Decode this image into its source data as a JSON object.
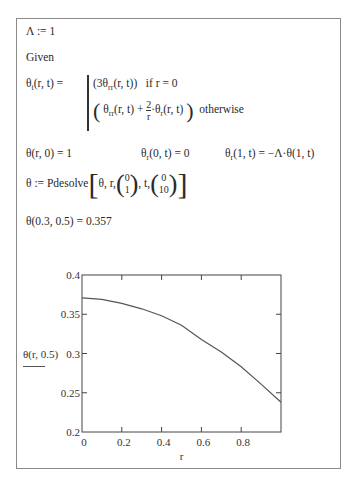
{
  "worksheet": {
    "lambda_def": "Λ := 1",
    "given_label": "Given",
    "pde": {
      "lhs_symbol": "θ",
      "lhs_sub": "t",
      "lhs_args": "(r, t) =",
      "case1_expr_open": "(3θ",
      "case1_sub": "rr",
      "case1_expr_close": "(r, t))",
      "case1_cond": "if  r = 0",
      "case2_theta": "θ",
      "case2_sub": "rr",
      "case2_args": "(r, t) +",
      "case2_frac_num": "2",
      "case2_frac_den": "r",
      "case2_dot_theta": "·θ",
      "case2_sub2": "r",
      "case2_args2": "(r, t)",
      "case2_cond": "otherwise"
    },
    "conditions": {
      "ic": "θ(r, 0) = 1",
      "bc1_theta": "θ",
      "bc1_sub": "r",
      "bc1_rest": "(0, t) = 0",
      "bc2_theta": "θ",
      "bc2_sub": "r",
      "bc2_rest": "(1, t) = −Λ·θ(1, t)"
    },
    "solve": {
      "lhs": "θ := Pdesolve",
      "args1": "θ, r,",
      "r_range": [
        "0",
        "1"
      ],
      "args2": ", t,",
      "t_range": [
        "0",
        "10"
      ]
    },
    "evaluation": "θ(0.3, 0.5) = 0.357"
  },
  "chart_data": {
    "type": "line",
    "title": "",
    "xlabel": "r",
    "ylabel": "θ(r, 0.5)",
    "xlim": [
      0,
      1
    ],
    "ylim": [
      0.2,
      0.4
    ],
    "x_ticks": [
      "0",
      "0.2",
      "0.4",
      "0.6",
      "0.8"
    ],
    "y_ticks": [
      "0.2",
      "0.25",
      "0.3",
      "0.35",
      "0.4"
    ],
    "grid": false,
    "legend": "none",
    "series": [
      {
        "name": "θ(r, 0.5)",
        "x": [
          0,
          0.1,
          0.2,
          0.3,
          0.4,
          0.5,
          0.6,
          0.7,
          0.8,
          0.9,
          1.0
        ],
        "values": [
          0.371,
          0.369,
          0.364,
          0.357,
          0.348,
          0.336,
          0.318,
          0.302,
          0.283,
          0.261,
          0.238
        ]
      }
    ],
    "colors": {
      "line": "#555555",
      "axes": "#444444"
    }
  }
}
